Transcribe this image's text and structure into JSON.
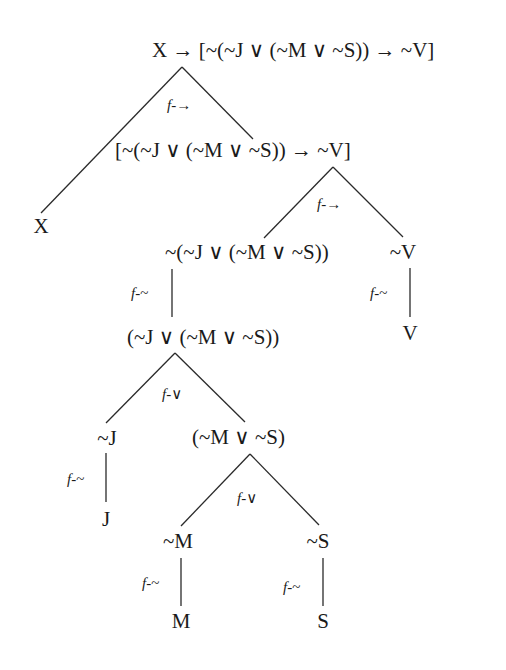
{
  "diagram": {
    "title": "",
    "line_color": "#2a2a2a",
    "nodes": [
      {
        "id": "root",
        "label": "X → [~(~J ∨ (~M ∨ ~S)) → ~V]",
        "x": 152,
        "y": 38,
        "align": "left"
      },
      {
        "id": "x1",
        "label": "X",
        "x": 41,
        "y": 214,
        "align": "center"
      },
      {
        "id": "cond",
        "label": "[~(~J ∨ (~M ∨ ~S)) → ~V]",
        "x": 115,
        "y": 138,
        "align": "left"
      },
      {
        "id": "neg",
        "label": "~(~J ∨ (~M ∨ ~S))",
        "x": 165,
        "y": 240,
        "align": "left"
      },
      {
        "id": "nv",
        "label": "~V",
        "x": 403,
        "y": 240,
        "align": "center"
      },
      {
        "id": "disj",
        "label": "(~J ∨ (~M ∨ ~S))",
        "x": 127,
        "y": 325,
        "align": "left"
      },
      {
        "id": "v",
        "label": "V",
        "x": 410,
        "y": 321,
        "align": "center"
      },
      {
        "id": "nj",
        "label": "~J",
        "x": 107,
        "y": 426,
        "align": "center"
      },
      {
        "id": "disj2",
        "label": "(~M ∨ ~S)",
        "x": 192,
        "y": 425,
        "align": "left"
      },
      {
        "id": "j",
        "label": "J",
        "x": 106,
        "y": 507,
        "align": "center"
      },
      {
        "id": "nm",
        "label": "~M",
        "x": 178,
        "y": 529,
        "align": "center"
      },
      {
        "id": "ns",
        "label": "~S",
        "x": 318,
        "y": 529,
        "align": "center"
      },
      {
        "id": "m",
        "label": "M",
        "x": 181,
        "y": 609,
        "align": "center"
      },
      {
        "id": "s",
        "label": "S",
        "x": 323,
        "y": 609,
        "align": "center"
      }
    ],
    "edges": [
      {
        "x1": 182,
        "y1": 67,
        "x2": 41,
        "y2": 213
      },
      {
        "x1": 182,
        "y1": 67,
        "x2": 253,
        "y2": 139
      },
      {
        "x1": 333,
        "y1": 167,
        "x2": 264,
        "y2": 238
      },
      {
        "x1": 333,
        "y1": 167,
        "x2": 403,
        "y2": 237
      },
      {
        "x1": 172,
        "y1": 269,
        "x2": 172,
        "y2": 317
      },
      {
        "x1": 410,
        "y1": 268,
        "x2": 410,
        "y2": 317
      },
      {
        "x1": 175,
        "y1": 353,
        "x2": 106,
        "y2": 423
      },
      {
        "x1": 175,
        "y1": 353,
        "x2": 245,
        "y2": 422
      },
      {
        "x1": 106,
        "y1": 453,
        "x2": 106,
        "y2": 502
      },
      {
        "x1": 250,
        "y1": 454,
        "x2": 181,
        "y2": 526
      },
      {
        "x1": 250,
        "y1": 454,
        "x2": 319,
        "y2": 525
      },
      {
        "x1": 181,
        "y1": 558,
        "x2": 181,
        "y2": 606
      },
      {
        "x1": 323,
        "y1": 558,
        "x2": 323,
        "y2": 606
      }
    ],
    "rules": [
      {
        "id": "r1",
        "f": "f",
        "op": "-→",
        "x": 167,
        "y": 96
      },
      {
        "id": "r2",
        "f": "f",
        "op": "-→",
        "x": 317,
        "y": 195
      },
      {
        "id": "r3",
        "f": "f",
        "op": "-~",
        "x": 131,
        "y": 284
      },
      {
        "id": "r4",
        "f": "f",
        "op": "-~",
        "x": 370,
        "y": 284
      },
      {
        "id": "r5",
        "f": "f",
        "op": "-∨",
        "x": 162,
        "y": 385
      },
      {
        "id": "r6",
        "f": "f",
        "op": "-~",
        "x": 67,
        "y": 470
      },
      {
        "id": "r7",
        "f": "f",
        "op": "-∨",
        "x": 237,
        "y": 489
      },
      {
        "id": "r8",
        "f": "f",
        "op": "-~",
        "x": 142,
        "y": 574
      },
      {
        "id": "r9",
        "f": "f",
        "op": "-~",
        "x": 283,
        "y": 578
      }
    ]
  }
}
